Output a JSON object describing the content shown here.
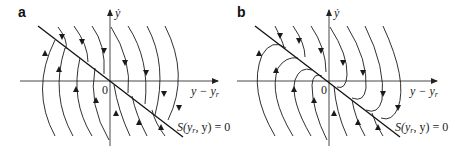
{
  "figure": {
    "panels": [
      {
        "id": "a",
        "label": "a",
        "y_axis_label": "ẏ",
        "x_axis_label": "y − y",
        "x_axis_sub": "r",
        "origin_label": "0",
        "surface_label_prefix": "S(y",
        "surface_label_sub": "r",
        "surface_label_suffix": ", y) = 0",
        "description": "Phase trajectories crossing the sliding surface (no sliding mode)"
      },
      {
        "id": "b",
        "label": "b",
        "y_axis_label": "ẏ",
        "x_axis_label": "y − y",
        "x_axis_sub": "r",
        "origin_label": "0",
        "surface_label_prefix": "S(y",
        "surface_label_sub": "r",
        "surface_label_suffix": ", y) = 0",
        "description": "Phase trajectories converging onto the sliding surface (sliding mode)"
      }
    ],
    "colors": {
      "line": "#1a1a1a",
      "axis": "#333333",
      "background": "#ffffff"
    }
  }
}
